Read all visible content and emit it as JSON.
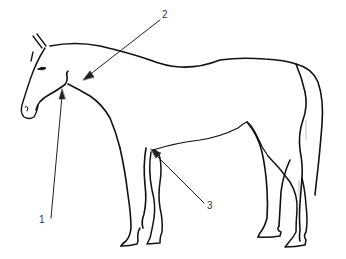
{
  "figure": {
    "stroke_color": "#111111",
    "background": "#ffffff",
    "labels": [
      {
        "id": "1",
        "text": "1",
        "x": 39,
        "y": 215,
        "target": "throat-latch"
      },
      {
        "id": "2",
        "text": "2",
        "x": 162,
        "y": 10,
        "target": "neck"
      },
      {
        "id": "3",
        "text": "3",
        "x": 207,
        "y": 201,
        "target": "stifle-flank"
      }
    ]
  }
}
